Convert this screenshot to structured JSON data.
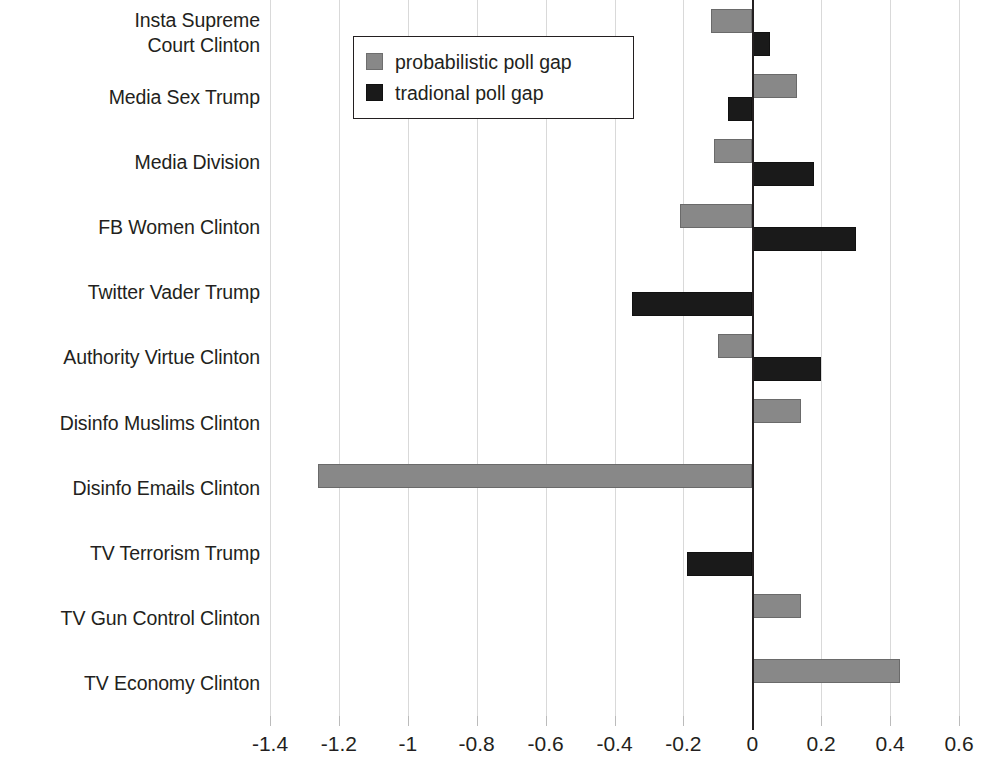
{
  "chart_data": {
    "type": "bar",
    "orientation": "horizontal",
    "title": "",
    "xlabel": "",
    "ylabel": "",
    "xlim": [
      -1.4,
      0.6
    ],
    "xticks": [
      -1.4,
      -1.2,
      -1,
      -0.8,
      -0.6,
      -0.4,
      -0.2,
      0,
      0.2,
      0.4,
      0.6
    ],
    "xtick_labels": [
      "-1.4",
      "-1.2",
      "-1",
      "-0.8",
      "-0.6",
      "-0.4",
      "-0.2",
      "0",
      "0.2",
      "0.4",
      "0.6"
    ],
    "grid": "vertical",
    "zero_line": true,
    "legend_position": "top-left-inside",
    "categories": [
      "Insta Supreme\nCourt Clinton",
      "Media Sex Trump",
      "Media Division",
      "FB Women Clinton",
      "Twitter Vader Trump",
      "Authority Virtue Clinton",
      "Disinfo Muslims Clinton",
      "Disinfo Emails Clinton",
      "TV Terrorism Trump",
      "TV Gun Control Clinton",
      "TV Economy Clinton"
    ],
    "series": [
      {
        "name": "probabilistic poll gap",
        "color": "#888888",
        "values": [
          -0.12,
          0.13,
          -0.11,
          -0.21,
          null,
          -0.1,
          0.14,
          -1.26,
          null,
          0.14,
          0.43
        ]
      },
      {
        "name": "tradional poll gap",
        "color": "#1a1a1a",
        "values": [
          0.05,
          -0.07,
          0.18,
          0.3,
          -0.35,
          0.2,
          null,
          null,
          -0.19,
          null,
          null
        ]
      }
    ]
  },
  "legend": {
    "entries": [
      {
        "label": "probabilistic poll gap",
        "swatch": "probabilistic-swatch"
      },
      {
        "label": "tradional poll gap",
        "swatch": "tradional-swatch"
      }
    ]
  }
}
